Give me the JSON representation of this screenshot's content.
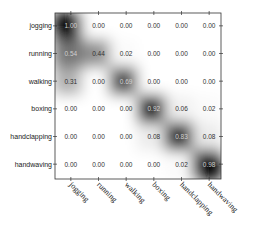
{
  "chart_data": {
    "type": "heatmap",
    "title": "",
    "xlabel": "",
    "ylabel": "",
    "row_labels": [
      "jogging",
      "running",
      "walking",
      "boxing",
      "handclapping",
      "handwaving"
    ],
    "col_labels": [
      "jogging",
      "running",
      "walking",
      "boxing",
      "handclapping",
      "handwaving"
    ],
    "values": [
      [
        1.0,
        0.0,
        0.0,
        0.0,
        0.0,
        0.0
      ],
      [
        0.54,
        0.44,
        0.02,
        0.0,
        0.0,
        0.0
      ],
      [
        0.31,
        0.0,
        0.69,
        0.0,
        0.0,
        0.0
      ],
      [
        0.0,
        0.0,
        0.0,
        0.92,
        0.06,
        0.02
      ],
      [
        0.0,
        0.0,
        0.0,
        0.08,
        0.83,
        0.08
      ],
      [
        0.0,
        0.0,
        0.0,
        0.0,
        0.02,
        0.98
      ]
    ],
    "colormap": "grayscale (white=0, black=1), smoothed",
    "grid": false,
    "legend": "none"
  }
}
